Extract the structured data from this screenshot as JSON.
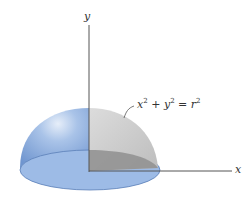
{
  "diagram": {
    "axes": {
      "y_label": "y",
      "x_label": "x"
    },
    "equation": {
      "x": "x",
      "plus": " + ",
      "y": "y",
      "equals": " = ",
      "r": "r",
      "exp": "2"
    },
    "colors": {
      "dome_blue": "#8fb0de",
      "base_blue": "#9dbbe6",
      "cutaway_gray": "#cfcfcf",
      "cutaway_dark": "#8a8a8a",
      "axis": "#555555"
    }
  }
}
